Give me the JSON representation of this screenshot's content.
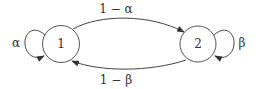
{
  "diagram": {
    "type": "markov-chain",
    "states": [
      {
        "id": "1",
        "label": "1",
        "self_loop_label": "α"
      },
      {
        "id": "2",
        "label": "2",
        "self_loop_label": "β"
      }
    ],
    "edges": [
      {
        "from": "1",
        "to": "2",
        "label": "1 − α"
      },
      {
        "from": "2",
        "to": "1",
        "label": "1 − β"
      },
      {
        "from": "1",
        "to": "1",
        "label": "α"
      },
      {
        "from": "2",
        "to": "2",
        "label": "β"
      }
    ]
  }
}
